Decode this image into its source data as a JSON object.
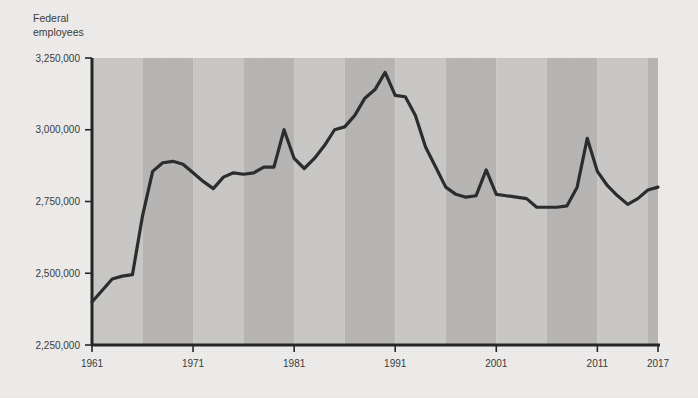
{
  "chart_data": {
    "type": "line",
    "title": "",
    "subtitle": "",
    "ylabel": "Federal employees",
    "xlabel": "",
    "ylim": [
      2250000,
      3250000
    ],
    "xlim": [
      1961,
      2017
    ],
    "grid": false,
    "legend": null,
    "annotations": [],
    "ytick_labels": [
      "3,250,000",
      "3,000,000",
      "2,750,000",
      "2,500,000",
      "2,250,000"
    ],
    "ytick_values": [
      3250000,
      3000000,
      2750000,
      2500000,
      2250000
    ],
    "xtick_labels": [
      "1961",
      "1971",
      "1981",
      "1991",
      "2001",
      "2011",
      "2017"
    ],
    "xtick_values": [
      1961,
      1971,
      1981,
      1991,
      2001,
      2011,
      2017
    ],
    "band_interval_years": 5,
    "band_color_light": "#c9c8c6",
    "band_color_dark": "#b7b6b4",
    "line_color": "#2d2d2d",
    "axis_color": "#262626",
    "background_color": "#edecea",
    "series": [
      {
        "name": "Federal employees",
        "x": [
          1961,
          1962,
          1963,
          1964,
          1965,
          1966,
          1967,
          1968,
          1969,
          1970,
          1971,
          1972,
          1973,
          1974,
          1975,
          1976,
          1977,
          1978,
          1979,
          1980,
          1981,
          1982,
          1983,
          1984,
          1985,
          1986,
          1987,
          1988,
          1989,
          1990,
          1991,
          1992,
          1993,
          1994,
          1995,
          1996,
          1997,
          1998,
          1999,
          2000,
          2001,
          2002,
          2003,
          2004,
          2005,
          2006,
          2007,
          2008,
          2009,
          2010,
          2011,
          2012,
          2013,
          2014,
          2015,
          2016,
          2017
        ],
        "values": [
          2400000,
          2440000,
          2480000,
          2490000,
          2495000,
          2700000,
          2855000,
          2885000,
          2890000,
          2880000,
          2850000,
          2820000,
          2795000,
          2835000,
          2850000,
          2845000,
          2850000,
          2870000,
          2870000,
          3000000,
          2900000,
          2865000,
          2900000,
          2945000,
          3000000,
          3010000,
          3050000,
          3110000,
          3140000,
          3200000,
          3120000,
          3115000,
          3050000,
          2940000,
          2870000,
          2800000,
          2775000,
          2765000,
          2770000,
          2860000,
          2775000,
          2770000,
          2765000,
          2760000,
          2730000,
          2730000,
          2730000,
          2735000,
          2800000,
          2970000,
          2855000,
          2805000,
          2770000,
          2740000,
          2760000,
          2790000,
          2800000
        ]
      }
    ]
  }
}
